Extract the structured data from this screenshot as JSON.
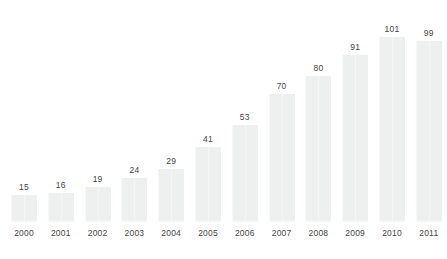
{
  "chart_data": {
    "type": "bar",
    "title": "",
    "subtitle": "",
    "xlabel": "",
    "ylabel": "",
    "categories": [
      "2000",
      "2001",
      "2002",
      "2003",
      "2004",
      "2005",
      "2006",
      "2007",
      "2008",
      "2009",
      "2010",
      "2011"
    ],
    "values": [
      15,
      16,
      19,
      24,
      29,
      41,
      53,
      70,
      80,
      91,
      101,
      99
    ],
    "value_labels": [
      "15",
      "16",
      "19",
      "24",
      "29",
      "41",
      "53",
      "70",
      "80",
      "91",
      "101",
      "99"
    ],
    "ylim": [
      0,
      101
    ],
    "grid": false,
    "legend": false,
    "legend_position": "none",
    "annotations": [],
    "axis_line": false,
    "data_labels_shown": true,
    "data_label_position": "above-bar"
  },
  "style": {
    "bar_color": "#eeefef",
    "label_color": "#444444",
    "background_color": "#ffffff"
  }
}
